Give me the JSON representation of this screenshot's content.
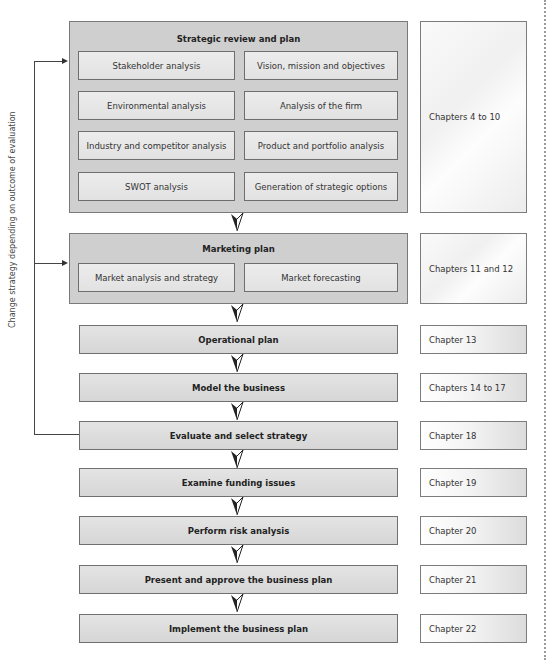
{
  "diagram": {
    "feedback_label": "Change strategy depending on outcome of evaluation",
    "strategic_group": {
      "title": "Strategic review and plan",
      "items": [
        "Stakeholder analysis",
        "Vision, mission and objectives",
        "Environmental analysis",
        "Analysis of the firm",
        "Industry and competitor analysis",
        "Product and portfolio analysis",
        "SWOT analysis",
        "Generation of strategic options"
      ],
      "chapters": "Chapters 4 to 10"
    },
    "marketing_group": {
      "title": "Marketing plan",
      "items": [
        "Market analysis and strategy",
        "Market forecasting"
      ],
      "chapters": "Chapters 11 and 12"
    },
    "steps": [
      {
        "label": "Operational plan",
        "chapters": "Chapter 13"
      },
      {
        "label": "Model the business",
        "chapters": "Chapters 14 to 17"
      },
      {
        "label": "Evaluate and select strategy",
        "chapters": "Chapter 18"
      },
      {
        "label": "Examine funding issues",
        "chapters": "Chapter 19"
      },
      {
        "label": "Perform risk analysis",
        "chapters": "Chapter 20"
      },
      {
        "label": "Present and approve the business plan",
        "chapters": "Chapter 21"
      },
      {
        "label": "Implement the business plan",
        "chapters": "Chapter 22"
      }
    ],
    "colors": {
      "group_fill": "#cfcfcf",
      "box_border": "#707070",
      "line": "#444444"
    }
  }
}
